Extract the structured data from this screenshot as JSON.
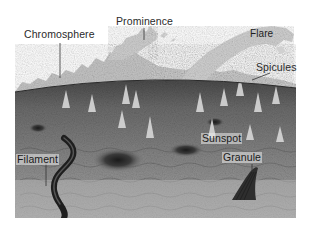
{
  "figure": {
    "labels": {
      "chromosphere": "Chromosphere",
      "prominence": "Prominence",
      "flare": "Flare",
      "spicules": "Spicules",
      "sunspot": "Sunspot",
      "granule": "Granule",
      "filament": "Filament"
    },
    "colors": {
      "background": "#ffffff",
      "photosphere": "#8a8a8a",
      "photosphere_dark": "#4a4a4a",
      "chromosphere": "#c4c4c4",
      "prominence": "#cfcfcf",
      "flare": "#d0d0d0",
      "label_text": "#2a2a2a",
      "leader_line": "#333333"
    }
  }
}
